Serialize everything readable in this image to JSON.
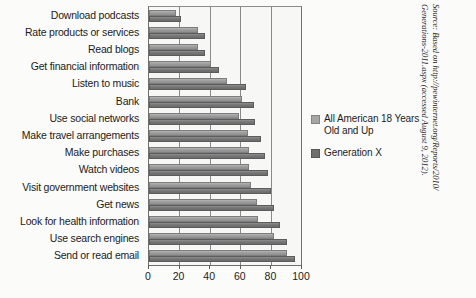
{
  "chart_data": {
    "type": "bar",
    "orientation": "horizontal",
    "title": "",
    "xlabel": "",
    "ylabel": "",
    "xlim": [
      0,
      100
    ],
    "xticks": [
      0,
      20,
      40,
      60,
      80,
      100
    ],
    "grid": true,
    "legend_position": "right",
    "categories": [
      "Download podcasts",
      "Rate products or services",
      "Read blogs",
      "Get financial information",
      "Listen to music",
      "Bank",
      "Use social networks",
      "Make travel arrangements",
      "Make purchases",
      "Watch videos",
      "Visit government websites",
      "Get news",
      "Look for health information",
      "Use search engines",
      "Send or read email"
    ],
    "series": [
      {
        "name": "All American 18 Years Old and Up",
        "color": "#a6a6a6",
        "values": [
          18,
          32,
          32,
          41,
          51,
          61,
          59,
          65,
          66,
          66,
          67,
          71,
          72,
          82,
          91
        ]
      },
      {
        "name": "Generation X",
        "color": "#6f6f6f",
        "values": [
          21,
          37,
          37,
          46,
          64,
          69,
          70,
          74,
          76,
          78,
          80,
          82,
          86,
          91,
          96
        ]
      }
    ]
  },
  "legend": {
    "entries": [
      {
        "label_line1": "All American 18 Years",
        "label_line2": "Old and Up"
      },
      {
        "label_line1": "Generation X",
        "label_line2": ""
      }
    ]
  },
  "axis": {
    "tick_labels": [
      "0",
      "20",
      "40",
      "60",
      "80",
      "100"
    ]
  },
  "source": {
    "line1": "Source: Based on http://pewinternet.org/Reports/2010/",
    "line2": "Generations-2011.aspx (accessed August 9, 2012)."
  },
  "colors": {
    "series_light": "#a6a6a6",
    "series_dark": "#6f6f6f",
    "axis": "#6f6f6f",
    "grid": "#8a8a8a",
    "plot_background": "#f7f7f6",
    "text": "#1b1b1b"
  }
}
